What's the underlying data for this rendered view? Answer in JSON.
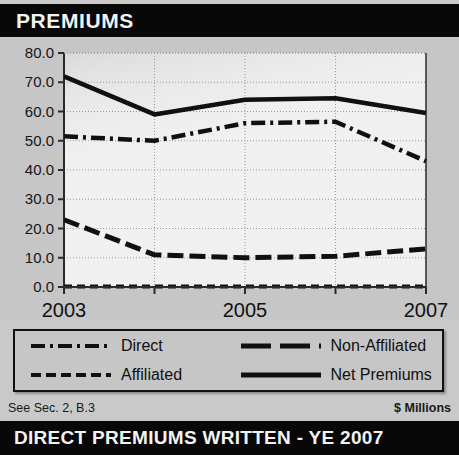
{
  "header": {
    "title": "PREMIUMS"
  },
  "footer": {
    "left_note": "See Sec. 2, B.3",
    "right_note": "$ Millions"
  },
  "bottom_banner": {
    "title": "DIRECT PREMIUMS WRITTEN - YE 2007"
  },
  "legend": {
    "items": [
      {
        "label": "Direct",
        "style": "dash-dot"
      },
      {
        "label": "Non-Affiliated",
        "style": "long-dash"
      },
      {
        "label": "Affiliated",
        "style": "fine-dash"
      },
      {
        "label": "Net Premiums",
        "style": "solid"
      }
    ]
  },
  "colors": {
    "banner_bg": "#080808",
    "banner_text": "#f2f2f2",
    "panel_bg": "#c6c6c6",
    "plot_bg": "#f0f0f0",
    "line": "#101010",
    "grid": "#9a9a9a",
    "axis": "#2a2a2a"
  },
  "chart_data": {
    "type": "line",
    "title": "PREMIUMS",
    "xlabel": "",
    "ylabel": "$ Millions",
    "x": [
      2003,
      2004,
      2005,
      2006,
      2007
    ],
    "categories": [
      "2003",
      "2004",
      "2005",
      "2006",
      "2007"
    ],
    "xtick_labels": [
      "2003",
      "",
      "2005",
      "",
      "2007"
    ],
    "ytick_labels": [
      "0.0",
      "10.0",
      "20.0",
      "30.0",
      "40.0",
      "50.0",
      "60.0",
      "70.0",
      "80.0"
    ],
    "ytick_values": [
      0,
      10,
      20,
      30,
      40,
      50,
      60,
      70,
      80
    ],
    "ylim": [
      0,
      80
    ],
    "xlim": [
      2003,
      2007
    ],
    "grid": true,
    "legend_position": "below",
    "series": [
      {
        "name": "Direct",
        "style": "dash-dot",
        "values": [
          51.5,
          50.0,
          56.0,
          56.5,
          43.0
        ]
      },
      {
        "name": "Non-Affiliated",
        "style": "long-dash",
        "values": [
          23.0,
          11.0,
          10.0,
          10.5,
          13.0
        ]
      },
      {
        "name": "Affiliated",
        "style": "fine-dash",
        "values": [
          0.2,
          0.2,
          0.2,
          0.2,
          0.2
        ]
      },
      {
        "name": "Net Premiums",
        "style": "solid",
        "values": [
          72.0,
          59.0,
          64.0,
          64.5,
          59.5
        ]
      }
    ]
  }
}
